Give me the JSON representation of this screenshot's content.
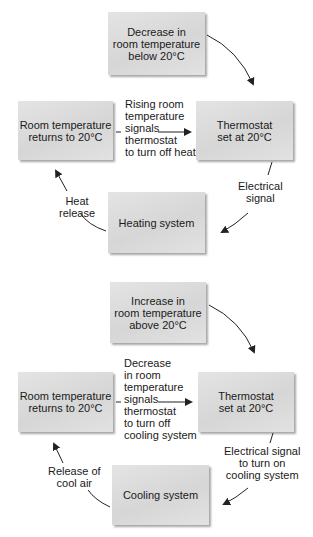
{
  "heating_loop": {
    "trigger": "Decrease in\nroom temperature\nbelow 20°C",
    "room": "Room temperature\nreturns to 20°C",
    "thermostat": "Thermostat\nset at 20°C",
    "system": "Heating system",
    "feedback_label": "Rising room\ntemperature\nsignals\nthermostat\nto turn off heat",
    "signal_label": "Electrical\nsignal",
    "release_label": "Heat\nrelease"
  },
  "cooling_loop": {
    "trigger": "Increase in\nroom temperature\nabove 20°C",
    "room": "Room temperature\nreturns to 20°C",
    "thermostat": "Thermostat\nset at 20°C",
    "system": "Cooling system",
    "feedback_label": "Decrease\nin room\ntemperature\nsignals\nthermostat\nto turn off\ncooling system",
    "signal_label": "Electrical signal\nto turn on\ncooling system",
    "release_label": "Release of\ncool air"
  },
  "colors": {
    "box_fill": "#dcdcdc",
    "text": "#1a1a1a",
    "arrow": "#222222"
  }
}
